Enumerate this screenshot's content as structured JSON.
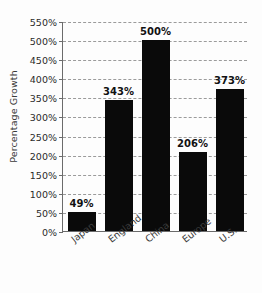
{
  "chart_data": {
    "type": "bar",
    "title": "",
    "xlabel": "",
    "ylabel": "Percentage Growth",
    "categories": [
      "Japan",
      "England",
      "China",
      "Europe",
      "U.S."
    ],
    "values": [
      49,
      343,
      500,
      206,
      373
    ],
    "value_labels": [
      "49%",
      "343%",
      "500%",
      "206%",
      "373%"
    ],
    "ylim": [
      0,
      550
    ],
    "ytick_values": [
      0,
      50,
      100,
      150,
      200,
      250,
      300,
      350,
      400,
      450,
      500,
      550
    ],
    "ytick_labels": [
      "0%",
      "50%",
      "100%",
      "150%",
      "200%",
      "250%",
      "300%",
      "350%",
      "400%",
      "450%",
      "500%",
      "550%"
    ],
    "grid": true,
    "grid_style": "dashed",
    "legend": false,
    "bar_color": "#0a0a0a",
    "grid_color": "#9b9b9b",
    "axis_color": "#6b6b6b"
  }
}
